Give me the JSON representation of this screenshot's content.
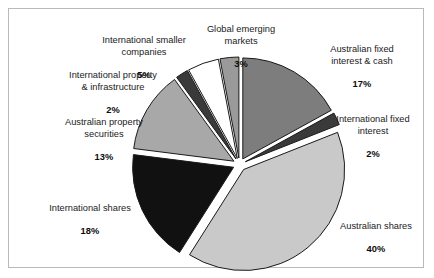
{
  "chart_data": {
    "type": "pie",
    "title": "",
    "legend_position": "callout-labels",
    "grid": false,
    "units": "percent",
    "total": 100,
    "categories": [
      "Australian fixed interest & cash",
      "International fixed interest",
      "Australian shares",
      "International shares",
      "Australian property securities",
      "International property & infrastructure",
      "International smaller companies",
      "Global emerging markets"
    ],
    "values": [
      17,
      2,
      40,
      18,
      13,
      2,
      5,
      3
    ],
    "slices": [
      {
        "label": "Australian fixed\ninterest & cash",
        "name": "Australian fixed interest & cash",
        "percent_text": "17%",
        "value": 17,
        "color": "#7d7d7d"
      },
      {
        "label": "International fixed\ninterest",
        "name": "International fixed interest",
        "percent_text": "2%",
        "value": 2,
        "color": "#3a3a3a"
      },
      {
        "label": "Australian shares",
        "name": "Australian shares",
        "percent_text": "40%",
        "value": 40,
        "color": "#c9c9c9"
      },
      {
        "label": "International shares",
        "name": "International shares",
        "percent_text": "18%",
        "value": 18,
        "color": "#111111"
      },
      {
        "label": "Australian property\nsecurities",
        "name": "Australian property securities",
        "percent_text": "13%",
        "value": 13,
        "color": "#a8a8a8"
      },
      {
        "label": "International property\n& infrastructure",
        "name": "International property & infrastructure",
        "percent_text": "2%",
        "value": 2,
        "color": "#3a3a3a"
      },
      {
        "label": "International smaller\ncompanies",
        "name": "International smaller companies",
        "percent_text": "5%",
        "value": 5,
        "color": "#ffffff"
      },
      {
        "label": "Global emerging\nmarkets",
        "name": "Global emerging markets",
        "percent_text": "3%",
        "value": 3,
        "color": "#9a9a9a"
      }
    ],
    "colors": {
      "background": "#ffffff",
      "frame_border": "#b9b9b9",
      "slice_outline": "#1a1a1a",
      "label_text": "#1b1b1b"
    }
  }
}
